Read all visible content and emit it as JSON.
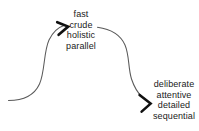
{
  "diagram": {
    "background_color": "#ffffff",
    "stroke_color": "#555555",
    "arrowhead_color": "#111111",
    "text_color": "#1a1a1a",
    "labels": [
      {
        "name": "fast-path-label",
        "lines": [
          "fast",
          "crude",
          "holistic",
          "parallel"
        ]
      },
      {
        "name": "slow-path-label",
        "lines": [
          "deliberate",
          "attentive",
          "detailed",
          "sequential"
        ]
      }
    ],
    "arrows": [
      {
        "name": "first-curved-arrow",
        "direction": "up-right",
        "arrowhead": "open-chevron"
      },
      {
        "name": "second-curved-arrow",
        "direction": "down-right",
        "arrowhead": "open-chevron"
      }
    ]
  }
}
